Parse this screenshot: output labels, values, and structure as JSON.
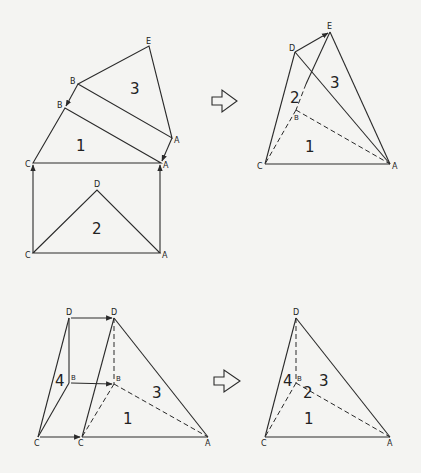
{
  "diagram": {
    "panels": [
      {
        "id": "top-left",
        "vertex_labels": [
          "E",
          "B",
          "B",
          "A",
          "A",
          "C",
          "D",
          "C",
          "A"
        ],
        "region_labels": [
          "3",
          "1",
          "2"
        ]
      },
      {
        "id": "top-right",
        "vertex_labels": [
          "E",
          "D",
          "B",
          "C",
          "A"
        ],
        "region_labels": [
          "2",
          "3",
          "1"
        ]
      },
      {
        "id": "bottom-left",
        "vertex_labels": [
          "D",
          "D",
          "B",
          "B",
          "C",
          "C",
          "A"
        ],
        "region_labels": [
          "4",
          "3",
          "1"
        ]
      },
      {
        "id": "bottom-right",
        "vertex_labels": [
          "D",
          "B",
          "C",
          "A"
        ],
        "region_labels": [
          "4",
          "3",
          "2",
          "1"
        ]
      }
    ],
    "arrows": [
      "transform-arrow-top",
      "transform-arrow-bottom"
    ]
  },
  "labels": {
    "tl": {
      "E": "E",
      "B1": "B",
      "B2": "B",
      "A1": "A",
      "A2": "A",
      "C": "C",
      "D": "D",
      "C2": "C",
      "A3": "A",
      "r3": "3",
      "r1": "1",
      "r2": "2"
    },
    "tr": {
      "E": "E",
      "D": "D",
      "B": "B",
      "C": "C",
      "A": "A",
      "r2": "2",
      "r3": "3",
      "r1": "1"
    },
    "bl": {
      "D1": "D",
      "D2": "D",
      "B1": "B",
      "B2": "B",
      "C1": "C",
      "C2": "C",
      "A": "A",
      "r4": "4",
      "r3": "3",
      "r1": "1"
    },
    "br": {
      "D": "D",
      "B": "B",
      "C": "C",
      "A": "A",
      "r4": "4",
      "r3": "3",
      "r2": "2",
      "r1": "1"
    }
  }
}
